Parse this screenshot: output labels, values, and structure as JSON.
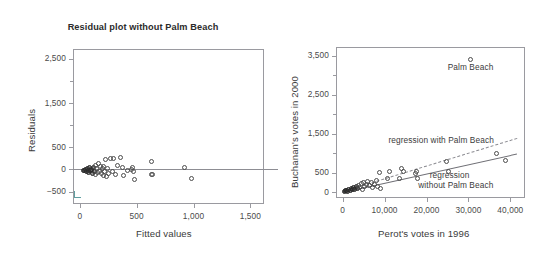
{
  "figure": {
    "background": "#ffffff",
    "axis_color": "#9a9aa0",
    "marker_color": "#4c4c4c",
    "text_color": "#3b3b3b"
  },
  "chart_data": [
    {
      "type": "scatter",
      "panel": "left",
      "title": "Residual plot without Palm Beach",
      "xlabel": "Fitted values",
      "ylabel": "Residuals",
      "xlim": [
        -60,
        1620
      ],
      "ylim": [
        -780,
        2720
      ],
      "xticks": [
        0,
        500,
        1000,
        1500
      ],
      "xticklabels": [
        "0",
        "500",
        "1,000",
        "1,500"
      ],
      "yticks": [
        -500,
        0,
        500,
        1500,
        2500
      ],
      "yticklabels": [
        "−500",
        "0",
        "500",
        "1,500",
        "2,500"
      ],
      "yminorticks": [
        1000,
        2000
      ],
      "grid": false,
      "legend": "none",
      "reference_line": {
        "y": 0,
        "style": "solid"
      },
      "points": [
        {
          "x": 30,
          "y": -20,
          "dense": true
        },
        {
          "x": 42,
          "y": -30,
          "dense": true
        },
        {
          "x": 50,
          "y": 10,
          "dense": true
        },
        {
          "x": 58,
          "y": -45,
          "dense": true
        },
        {
          "x": 66,
          "y": 20,
          "dense": true
        },
        {
          "x": 74,
          "y": -15,
          "dense": true
        },
        {
          "x": 80,
          "y": -60,
          "dense": true
        },
        {
          "x": 88,
          "y": 35,
          "dense": true
        },
        {
          "x": 96,
          "y": -25,
          "dense": true
        },
        {
          "x": 104,
          "y": 5,
          "dense": true
        },
        {
          "x": 112,
          "y": -80,
          "dense": true
        },
        {
          "x": 120,
          "y": 55,
          "dense": true
        },
        {
          "x": 128,
          "y": -40,
          "dense": true
        },
        {
          "x": 136,
          "y": 95,
          "dense": false
        },
        {
          "x": 142,
          "y": -110,
          "dense": false
        },
        {
          "x": 150,
          "y": 30,
          "dense": false
        },
        {
          "x": 158,
          "y": -60,
          "dense": false
        },
        {
          "x": 164,
          "y": 130,
          "dense": false
        },
        {
          "x": 172,
          "y": -35,
          "dense": false
        },
        {
          "x": 180,
          "y": 60,
          "dense": false
        },
        {
          "x": 188,
          "y": -95,
          "dense": false
        },
        {
          "x": 196,
          "y": 15,
          "dense": false
        },
        {
          "x": 204,
          "y": -130,
          "dense": false
        },
        {
          "x": 212,
          "y": 75,
          "dense": false
        },
        {
          "x": 220,
          "y": -55,
          "dense": false
        },
        {
          "x": 228,
          "y": 215,
          "dense": false
        },
        {
          "x": 236,
          "y": -150,
          "dense": false
        },
        {
          "x": 246,
          "y": 30,
          "dense": false
        },
        {
          "x": 256,
          "y": -100,
          "dense": false
        },
        {
          "x": 268,
          "y": 250,
          "dense": false
        },
        {
          "x": 284,
          "y": -55,
          "dense": false
        },
        {
          "x": 300,
          "y": 245,
          "dense": false
        },
        {
          "x": 312,
          "y": -120,
          "dense": false
        },
        {
          "x": 330,
          "y": 100,
          "dense": false
        },
        {
          "x": 358,
          "y": 265,
          "dense": false
        },
        {
          "x": 372,
          "y": 50,
          "dense": false
        },
        {
          "x": 382,
          "y": -135,
          "dense": false
        },
        {
          "x": 418,
          "y": -30,
          "dense": false
        },
        {
          "x": 452,
          "y": -10,
          "dense": false
        },
        {
          "x": 462,
          "y": 40,
          "dense": false
        },
        {
          "x": 470,
          "y": -55,
          "dense": false
        },
        {
          "x": 478,
          "y": -230,
          "dense": false
        },
        {
          "x": 628,
          "y": 190,
          "dense": false
        },
        {
          "x": 632,
          "y": -115,
          "dense": false
        },
        {
          "x": 640,
          "y": -105,
          "dense": false
        },
        {
          "x": 925,
          "y": 50,
          "dense": false
        },
        {
          "x": 985,
          "y": -205,
          "dense": false
        }
      ]
    },
    {
      "type": "scatter",
      "panel": "right",
      "title": "",
      "xlabel": "Perot's votes in 1996",
      "ylabel": "Buchanan's votes in 2000",
      "xlim": [
        -1600,
        43500
      ],
      "ylim": [
        -150,
        3720
      ],
      "xticks": [
        0,
        10000,
        20000,
        30000,
        40000
      ],
      "xticklabels": [
        "0",
        "10,000",
        "20,000",
        "30,000",
        "40,000"
      ],
      "yticks": [
        0,
        500,
        1500,
        2500,
        3500
      ],
      "yticklabels": [
        "0",
        "500",
        "1,500",
        "2,500",
        "3,500"
      ],
      "yminorticks": [
        1000,
        2000,
        3000
      ],
      "grid": false,
      "annotations": [
        {
          "name": "palm-beach-label",
          "text": "Palm Beach",
          "x": 30500,
          "y": 3180
        },
        {
          "name": "regression-with-label",
          "text": "regression with Palm Beach",
          "x": 23500,
          "y": 1320
        },
        {
          "name": "regression-without-label-line1",
          "text": "regression",
          "x": 25500,
          "y": 420
        },
        {
          "name": "regression-without-label-line2",
          "text": "without Palm Beach",
          "x": 27000,
          "y": 150
        }
      ],
      "series": [
        {
          "name": "regression with Palm Beach",
          "type": "line",
          "style": "dashed",
          "x": [
            0,
            41500
          ],
          "y": [
            20,
            1380
          ]
        },
        {
          "name": "regression without Palm Beach",
          "type": "line",
          "style": "solid",
          "x": [
            0,
            41500
          ],
          "y": [
            15,
            1000
          ]
        }
      ],
      "points": [
        {
          "x": 400,
          "y": 20,
          "dense": true
        },
        {
          "x": 700,
          "y": 40,
          "dense": true
        },
        {
          "x": 1000,
          "y": 55,
          "dense": true
        },
        {
          "x": 1250,
          "y": 25,
          "dense": true
        },
        {
          "x": 1500,
          "y": 70,
          "dense": true
        },
        {
          "x": 1750,
          "y": 45,
          "dense": true
        },
        {
          "x": 2000,
          "y": 95,
          "dense": true
        },
        {
          "x": 2300,
          "y": 60,
          "dense": true
        },
        {
          "x": 2600,
          "y": 110,
          "dense": true
        },
        {
          "x": 2900,
          "y": 80,
          "dense": true
        },
        {
          "x": 3200,
          "y": 145,
          "dense": true
        },
        {
          "x": 3500,
          "y": 105,
          "dense": true
        },
        {
          "x": 3800,
          "y": 175,
          "dense": false
        },
        {
          "x": 4100,
          "y": 120,
          "dense": false
        },
        {
          "x": 4400,
          "y": 215,
          "dense": false
        },
        {
          "x": 4700,
          "y": 60,
          "dense": false
        },
        {
          "x": 5000,
          "y": 250,
          "dense": false
        },
        {
          "x": 5300,
          "y": 150,
          "dense": false
        },
        {
          "x": 5700,
          "y": 195,
          "dense": false
        },
        {
          "x": 6000,
          "y": 275,
          "dense": false
        },
        {
          "x": 6400,
          "y": 165,
          "dense": false
        },
        {
          "x": 6800,
          "y": 235,
          "dense": false
        },
        {
          "x": 7100,
          "y": 130,
          "dense": false
        },
        {
          "x": 7600,
          "y": 205,
          "dense": false
        },
        {
          "x": 8000,
          "y": 290,
          "dense": false
        },
        {
          "x": 8400,
          "y": 150,
          "dense": false
        },
        {
          "x": 8700,
          "y": 500,
          "dense": false
        },
        {
          "x": 9000,
          "y": 100,
          "dense": false
        },
        {
          "x": 10600,
          "y": 340,
          "dense": false
        },
        {
          "x": 11200,
          "y": 520,
          "dense": false
        },
        {
          "x": 13600,
          "y": 340,
          "dense": false
        },
        {
          "x": 14000,
          "y": 600,
          "dense": false
        },
        {
          "x": 14500,
          "y": 520,
          "dense": false
        },
        {
          "x": 17300,
          "y": 480,
          "dense": false
        },
        {
          "x": 17600,
          "y": 530,
          "dense": false
        },
        {
          "x": 17800,
          "y": 340,
          "dense": false
        },
        {
          "x": 24700,
          "y": 790,
          "dense": false
        },
        {
          "x": 25200,
          "y": 540,
          "dense": false
        },
        {
          "x": 30500,
          "y": 3400,
          "dense": false
        },
        {
          "x": 36800,
          "y": 1000,
          "dense": false
        },
        {
          "x": 38800,
          "y": 800,
          "dense": false
        }
      ]
    }
  ]
}
